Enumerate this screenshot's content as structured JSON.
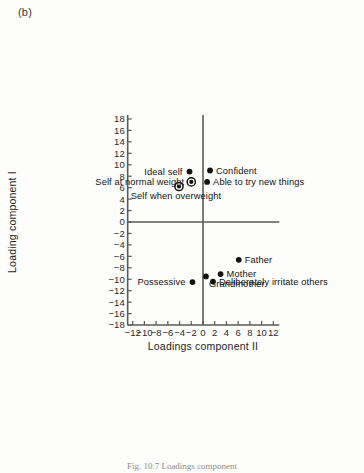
{
  "figure": {
    "panel_label": "(b)",
    "caption_fragment": "Fig. 10.7  Loadings component"
  },
  "chart_data": {
    "type": "scatter",
    "title": "",
    "xlabel": "Loadings component II",
    "ylabel": "Loading component I",
    "xlim": [
      -13,
      13
    ],
    "ylim": [
      -19,
      18
    ],
    "xticks": [
      -12,
      -10,
      -8,
      -6,
      -4,
      -2,
      0,
      2,
      4,
      6,
      8,
      10,
      12
    ],
    "yticks": [
      -18,
      -16,
      -14,
      -12,
      -10,
      -8,
      -6,
      -4,
      -2,
      0,
      2,
      4,
      6,
      8,
      10,
      12,
      14,
      16,
      18
    ],
    "xtick_labels": [
      "−12",
      "−10",
      "−8",
      "−6",
      "−4",
      "−2",
      "0",
      "2",
      "4",
      "6",
      "8",
      "10",
      "12"
    ],
    "ytick_labels": [
      "−18",
      "−16",
      "−14",
      "−12",
      "−10",
      "−8",
      "−6",
      "−4",
      "−2",
      "0",
      "2",
      "4",
      "6",
      "8",
      "10",
      "12",
      "14",
      "16",
      "18"
    ],
    "grid": false,
    "legend": "none",
    "axes_style": "crossed-at-origin",
    "marker_color": "#121212",
    "points": [
      {
        "label": "Ideal self",
        "x": -2.3,
        "y": 8.8,
        "marker": "dot",
        "label_side": "left"
      },
      {
        "label": "Self at normal weight",
        "x": -2.0,
        "y": 7.0,
        "marker": "ring",
        "label_side": "left"
      },
      {
        "label": "Self when overweight",
        "x": -4.1,
        "y": 6.2,
        "marker": "ring",
        "label_side": "below"
      },
      {
        "label": "Confident",
        "x": 1.2,
        "y": 9.0,
        "marker": "dot",
        "label_side": "right"
      },
      {
        "label": "Able to try new things",
        "x": 0.7,
        "y": 7.0,
        "marker": "dot",
        "label_side": "right"
      },
      {
        "label": "Father",
        "x": 6.1,
        "y": -6.6,
        "marker": "dot",
        "label_side": "right"
      },
      {
        "label": "Mother",
        "x": 3.0,
        "y": -9.1,
        "marker": "dot",
        "label_side": "right"
      },
      {
        "label": "Grandmother",
        "x": 0.5,
        "y": -9.5,
        "marker": "dot",
        "label_side": "right-below"
      },
      {
        "label": "Deliberately irritate others",
        "x": 1.7,
        "y": -10.4,
        "marker": "dot",
        "label_side": "right"
      },
      {
        "label": "Possessive",
        "x": -1.8,
        "y": -10.5,
        "marker": "dot",
        "label_side": "left"
      }
    ]
  }
}
